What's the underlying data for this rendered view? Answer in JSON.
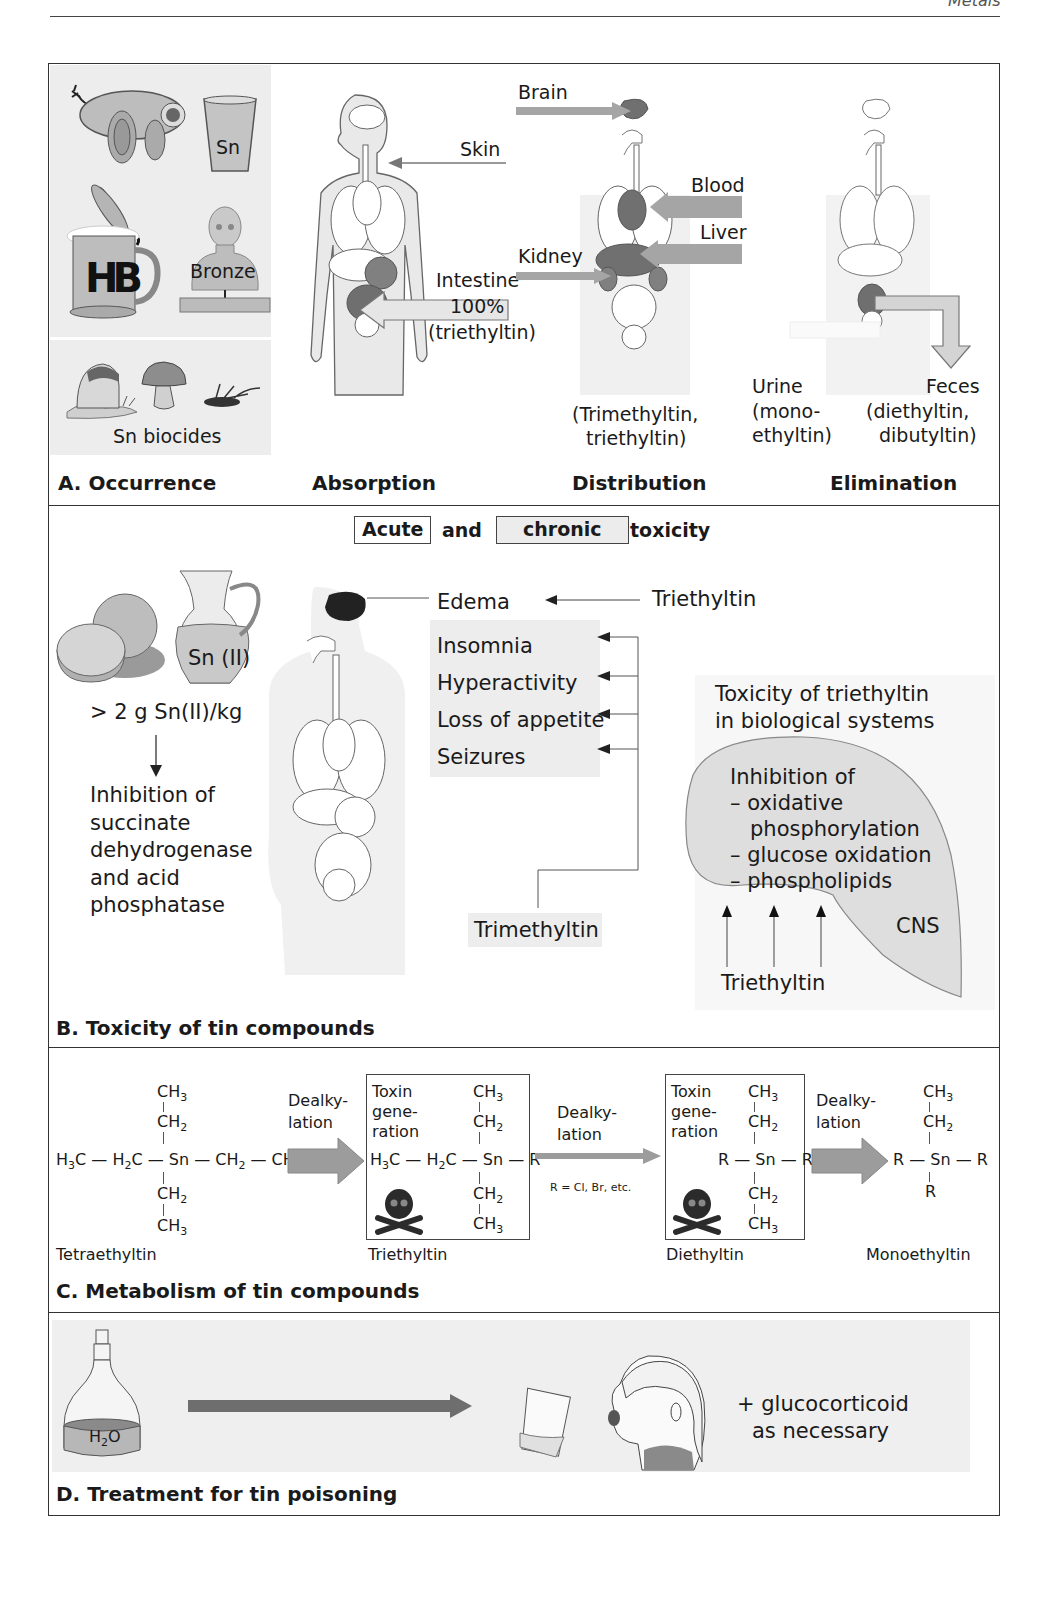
{
  "page": {
    "running_head": "Metals"
  },
  "sectionA": {
    "caption": "A. Occurrence",
    "occurrence": {
      "cup_label": "Sn",
      "mug_label": "HB",
      "bust_label": "Bronze",
      "biocides_label": "Sn biocides"
    },
    "absorption": {
      "title": "Absorption",
      "skin": "Skin",
      "intestine": "Intestine",
      "percent": "100%",
      "compound": "(triethyltin)"
    },
    "distribution": {
      "title": "Distribution",
      "brain": "Brain",
      "blood": "Blood",
      "liver": "Liver",
      "kidney": "Kidney",
      "compounds_line1": "(Trimethyltin,",
      "compounds_line2": "triethyltin)"
    },
    "elimination": {
      "title": "Elimination",
      "urine": "Urine",
      "urine_c1": "(mono-",
      "urine_c2": "ethyltin)",
      "feces": "Feces",
      "feces_c1": "(diethyltin,",
      "feces_c2": "dibutyltin)"
    }
  },
  "sectionB": {
    "caption": "B. Toxicity of tin compounds",
    "heading": {
      "acute": "Acute",
      "and": "and",
      "chronic": "chronic",
      "toxicity": "toxicity"
    },
    "jug_label": "Sn (II)",
    "dose": "> 2 g Sn(II)/kg",
    "inhibition_lines": [
      "Inhibition of",
      "succinate",
      "dehydrogenase",
      "and acid",
      "phosphatase"
    ],
    "edema": "Edema",
    "triethyltin_top": "Triethyltin",
    "symptoms": [
      "Insomnia",
      "Hyperactivity",
      "Loss of appetite",
      "Seizures"
    ],
    "trimethyltin": "Trimethyltin",
    "bio_title_1": "Toxicity of triethyltin",
    "bio_title_2": "in biological systems",
    "cns_lines": [
      "Inhibition of",
      "– oxidative",
      "phosphorylation",
      "– glucose oxidation",
      "– phospholipids"
    ],
    "cns_label": "CNS",
    "triethyltin_bottom": "Triethyltin"
  },
  "sectionC": {
    "caption": "C. Metabolism of tin compounds",
    "step1_label_1": "Dealky-",
    "step1_label_2": "lation",
    "step2_label_1": "Dealky-",
    "step2_label_2": "lation",
    "step2_note": "R = Cl, Br, etc.",
    "step3_label_1": "Dealky-",
    "step3_label_2": "lation",
    "toxin_1": "Toxin",
    "toxin_2": "gene-",
    "toxin_3": "ration",
    "compounds": [
      "Tetraethyltin",
      "Triethyltin",
      "Diethyltin",
      "Monoethyltin"
    ]
  },
  "sectionD": {
    "caption": "D. Treatment for tin poisoning",
    "bottle_label": "H2O",
    "note_1": "+ glucocorticoid",
    "note_2": "as necessary"
  },
  "colors": {
    "frame": "#333333",
    "panel_gray": "#ececec",
    "organ_dark": "#6f6f6f",
    "arrow_gray": "#a8a8a8",
    "skull": "#2b2b2b"
  }
}
